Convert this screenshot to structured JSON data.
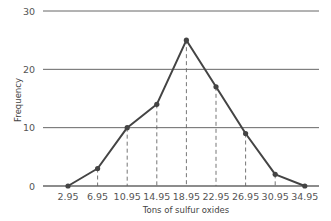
{
  "chart_data": {
    "type": "line",
    "title": "",
    "xlabel": "Tons of sulfur oxides",
    "ylabel": "Frequency",
    "categories": [
      "2.95",
      "6.95",
      "10.95",
      "14.95",
      "18.95",
      "22.95",
      "26.95",
      "30.95",
      "34.95"
    ],
    "x": [
      2.95,
      6.95,
      10.95,
      14.95,
      18.95,
      22.95,
      26.95,
      30.95,
      34.95
    ],
    "values": [
      0,
      3,
      10,
      14,
      25,
      17,
      9,
      2,
      0
    ],
    "yticks": [
      "0",
      "10",
      "20",
      "30"
    ],
    "ylim": [
      0,
      30
    ],
    "grid": true,
    "drop_lines": "dashed",
    "legend": null
  },
  "colors": {
    "line": "#444444",
    "grid": "#666666",
    "text": "#555555"
  }
}
